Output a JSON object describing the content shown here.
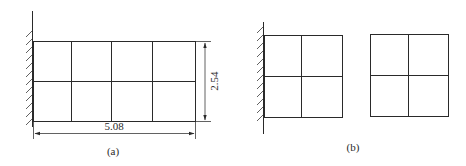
{
  "figure": {
    "panel_a": {
      "label": "(a)",
      "mesh": {
        "columns": 4,
        "rows": 2
      },
      "support": "fixed-wall-left",
      "dimensions": {
        "width": "5.08",
        "height": "2.54"
      }
    },
    "panel_b": {
      "label": "(b)",
      "meshes": [
        {
          "columns": 2,
          "rows": 2,
          "support": "fixed-wall-left"
        },
        {
          "columns": 2,
          "rows": 2,
          "support": "none"
        }
      ]
    },
    "colors": {
      "line": "#2a2a2a",
      "background": "#ffffff"
    }
  }
}
